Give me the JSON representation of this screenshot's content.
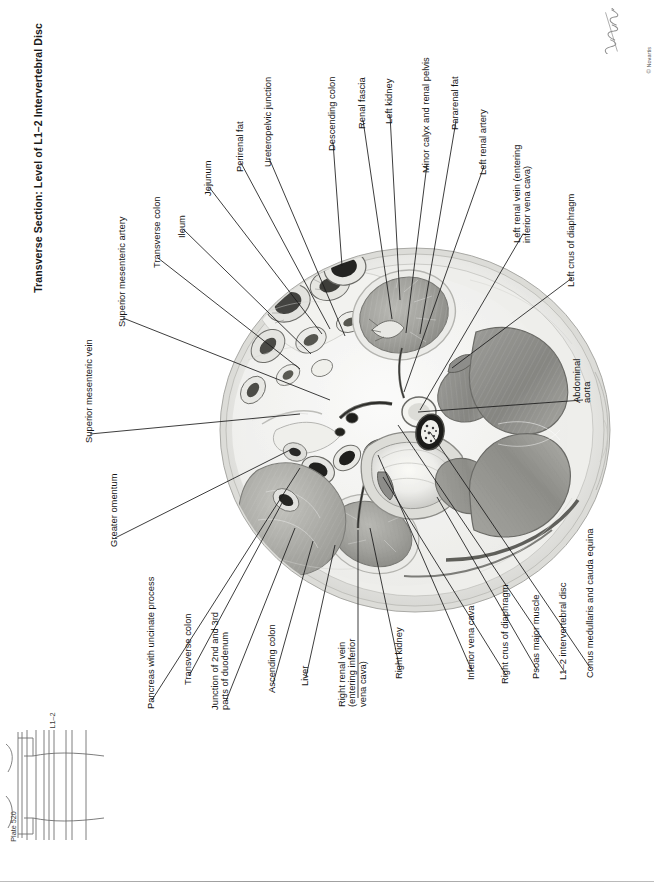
{
  "plate": {
    "title": "Transverse Section: Level of L1–2 Intervertebral Disc",
    "plate_number": "Plate 520",
    "level_label": "L1–2",
    "copyright": "© Novartis",
    "signature_alt": "artist-signature"
  },
  "labels": [
    {
      "id": "superior-mesenteric-vein",
      "text": "Superior mesenteric vein",
      "x": 84,
      "y": 443,
      "line": [
        [
          90,
          434
        ],
        [
          300,
          414
        ]
      ]
    },
    {
      "id": "superior-mesenteric-artery",
      "text": "Superior mesenteric artery",
      "x": 117,
      "y": 327,
      "line": [
        [
          123,
          318
        ],
        [
          330,
          400
        ]
      ]
    },
    {
      "id": "transverse-colon-upper",
      "text": "Transverse colon",
      "x": 152,
      "y": 268,
      "line": [
        [
          158,
          258
        ],
        [
          300,
          369
        ]
      ]
    },
    {
      "id": "ileum",
      "text": "Ileum",
      "x": 177,
      "y": 238,
      "line": [
        [
          183,
          229
        ],
        [
          311,
          354
        ]
      ]
    },
    {
      "id": "jejunum",
      "text": "Jejunum",
      "x": 203,
      "y": 196,
      "line": [
        [
          209,
          187
        ],
        [
          322,
          334
        ]
      ]
    },
    {
      "id": "perirenal-fat",
      "text": "Perirenal fat",
      "x": 235,
      "y": 172,
      "line": [
        [
          241,
          163
        ],
        [
          330,
          329
        ]
      ]
    },
    {
      "id": "ureteropelvic-junction",
      "text": "Ureteropelvic junction",
      "x": 263,
      "y": 167,
      "line": [
        [
          269,
          158
        ],
        [
          345,
          336
        ]
      ]
    },
    {
      "id": "descending-colon",
      "text": "Descending colon",
      "x": 327,
      "y": 151,
      "line": [
        [
          333,
          142
        ],
        [
          342,
          266
        ]
      ]
    },
    {
      "id": "renal-fascia",
      "text": "Renal fascia",
      "x": 357,
      "y": 129,
      "line": [
        [
          363,
          120
        ],
        [
          392,
          319
        ]
      ]
    },
    {
      "id": "left-kidney",
      "text": "Left kidney",
      "x": 384,
      "y": 124,
      "line": [
        [
          390,
          115
        ],
        [
          400,
          300
        ]
      ]
    },
    {
      "id": "minor-calyx-renal-pelvis",
      "text": "Minor calyx and renal pelvis",
      "x": 421,
      "y": 173,
      "line": [
        [
          427,
          164
        ],
        [
          406,
          333
        ]
      ]
    },
    {
      "id": "pararenal-fat",
      "text": "Pararenal fat",
      "x": 450,
      "y": 130,
      "line": [
        [
          456,
          121
        ],
        [
          420,
          334
        ]
      ]
    },
    {
      "id": "left-renal-artery",
      "text": "Left renal artery",
      "x": 478,
      "y": 175,
      "line": [
        [
          484,
          166
        ],
        [
          404,
          392
        ]
      ]
    },
    {
      "id": "left-renal-vein",
      "text": "Left renal vein (entering\ninferior vena cava)",
      "x": 512,
      "y": 243,
      "line": [
        [
          523,
          234
        ],
        [
          420,
          410
        ]
      ]
    },
    {
      "id": "left-crus-of-diaphragm",
      "text": "Left crus of diaphragm",
      "x": 566,
      "y": 287,
      "line": [
        [
          572,
          278
        ],
        [
          452,
          368
        ]
      ]
    },
    {
      "id": "abdominal-aorta",
      "text": "Abdominal\naorta",
      "x": 572,
      "y": 403,
      "line": [
        [
          583,
          400
        ],
        [
          418,
          412
        ]
      ]
    },
    {
      "id": "conus-medullaris",
      "text": "Conus medullaris and cauda equina",
      "x": 585,
      "y": 678,
      "line": [
        [
          591,
          669
        ],
        [
          430,
          432
        ]
      ]
    },
    {
      "id": "l1-2-intervertebral-disc",
      "text": "L1–2 intervertebral disc",
      "x": 558,
      "y": 680,
      "line": [
        [
          564,
          671
        ],
        [
          398,
          425
        ]
      ]
    },
    {
      "id": "psoas-major-muscle",
      "text": "Psoas major muscle",
      "x": 531,
      "y": 679,
      "line": [
        [
          537,
          670
        ],
        [
          437,
          497
        ]
      ]
    },
    {
      "id": "right-crus-of-diaphragm",
      "text": "Right crus of diaphragm",
      "x": 500,
      "y": 684,
      "line": [
        [
          506,
          675
        ],
        [
          383,
          477
        ]
      ]
    },
    {
      "id": "inferior-vena-cava",
      "text": "Inferior vena cava",
      "x": 466,
      "y": 680,
      "line": [
        [
          472,
          671
        ],
        [
          378,
          455
        ]
      ]
    },
    {
      "id": "right-kidney",
      "text": "Right kidney",
      "x": 394,
      "y": 679,
      "line": [
        [
          400,
          670
        ],
        [
          370,
          528
        ]
      ]
    },
    {
      "id": "right-renal-vein",
      "text": "Right renal vein\n(entering inferior\nvena cava)",
      "x": 337,
      "y": 707,
      "line": [
        [
          358,
          698
        ],
        [
          358,
          530
        ]
      ]
    },
    {
      "id": "liver",
      "text": "Liver",
      "x": 300,
      "y": 686,
      "line": [
        [
          306,
          677
        ],
        [
          335,
          545
        ]
      ]
    },
    {
      "id": "ascending-colon",
      "text": "Ascending colon",
      "x": 267,
      "y": 693,
      "line": [
        [
          273,
          684
        ],
        [
          313,
          541
        ]
      ]
    },
    {
      "id": "junction-duodenum",
      "text": "Junction of 2nd and 3rd\nparts of duodenum",
      "x": 210,
      "y": 710,
      "line": [
        [
          226,
          701
        ],
        [
          295,
          528
        ]
      ]
    },
    {
      "id": "transverse-colon-lower",
      "text": "Transverse colon",
      "x": 183,
      "y": 685,
      "line": [
        [
          189,
          676
        ],
        [
          282,
          503
        ]
      ]
    },
    {
      "id": "pancreas-uncinate",
      "text": "Pancreas with uncinate process",
      "x": 146,
      "y": 709,
      "line": [
        [
          152,
          700
        ],
        [
          300,
          468
        ]
      ]
    },
    {
      "id": "greater-omentum",
      "text": "Greater omentum",
      "x": 109,
      "y": 547,
      "line": [
        [
          115,
          538
        ],
        [
          290,
          450
        ]
      ]
    }
  ]
}
